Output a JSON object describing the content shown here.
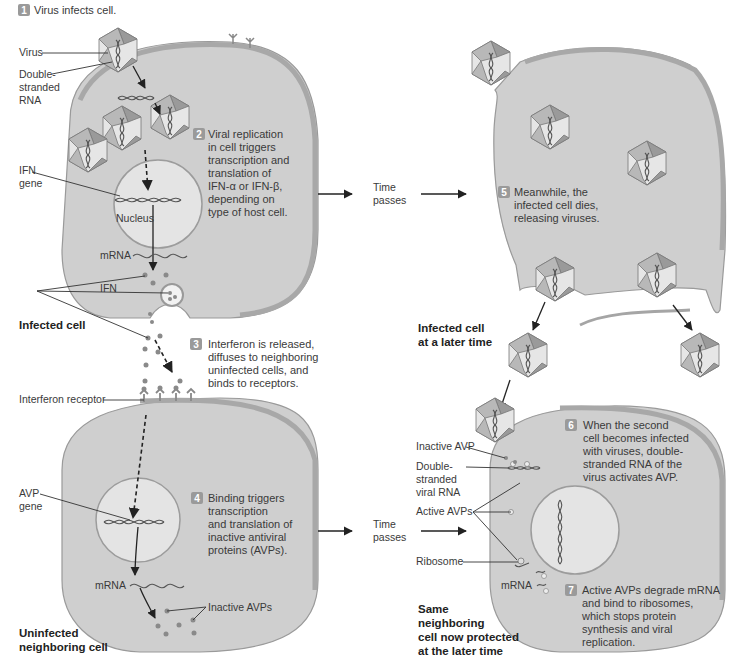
{
  "steps": [
    {
      "number": "1",
      "lines": [
        "Virus infects cell."
      ]
    },
    {
      "number": "2",
      "lines": [
        "Viral replication",
        "in cell triggers",
        "transcription and",
        "translation of",
        "IFN-α or IFN-β,",
        "depending on",
        "type of host cell."
      ]
    },
    {
      "number": "3",
      "lines": [
        "Interferon is released,",
        "diffuses to neighboring",
        "uninfected cells, and",
        "binds to receptors."
      ]
    },
    {
      "number": "4",
      "lines": [
        "Binding triggers",
        "transcription",
        "and translation of",
        "inactive antiviral",
        "proteins (AVPs)."
      ]
    },
    {
      "number": "5",
      "lines": [
        "Meanwhile, the",
        "infected cell dies,",
        "releasing viruses."
      ]
    },
    {
      "number": "6",
      "lines": [
        "When the second",
        "cell becomes infected",
        "with viruses, double-",
        "stranded RNA of the",
        "virus activates AVP."
      ]
    },
    {
      "number": "7",
      "lines": [
        "Active AVPs degrade mRNA",
        "and bind to ribosomes,",
        "which stops protein",
        "synthesis and viral",
        "replication."
      ]
    }
  ],
  "labels": {
    "virus": "Virus",
    "ds_rna": [
      "Double-",
      "stranded",
      "RNA"
    ],
    "ifn_gene": [
      "IFN",
      "gene"
    ],
    "nucleus": "Nucleus",
    "mrna_top": "mRNA",
    "ifn": "IFN",
    "interferon_receptor": "Interferon receptor",
    "avp_gene": [
      "AVP",
      "gene"
    ],
    "mrna_bottom": "mRNA",
    "inactive_avps": "Inactive AVPs",
    "inactive_avp": "Inactive AVP",
    "ds_viral_rna": [
      "Double-",
      "stranded",
      "viral RNA"
    ],
    "active_avps": "Active AVPs",
    "ribosome": "Ribosome",
    "mrna_right": "mRNA"
  },
  "time_passes": [
    "Time",
    "passes"
  ],
  "cell_titles": {
    "infected": [
      "Infected cell"
    ],
    "infected_later": [
      "Infected cell",
      "at a later time"
    ],
    "uninfected": [
      "Uninfected",
      "neighboring cell"
    ],
    "protected": [
      "Same",
      "neighboring",
      "cell now protected",
      "at the later time"
    ]
  },
  "colors": {
    "cell_fill": "#cfcfcf",
    "badge": "#9a9a9a",
    "nucleus": "#e4e4e4"
  }
}
